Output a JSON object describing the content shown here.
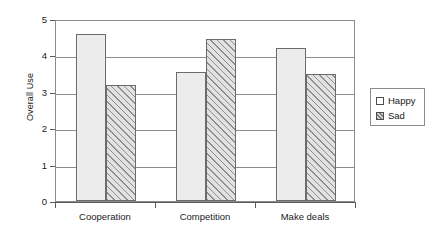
{
  "chart_data": {
    "type": "bar",
    "title": "",
    "xlabel": "",
    "ylabel": "Overall Use",
    "ylim": [
      0,
      5
    ],
    "ytick_labels": [
      "0",
      "1",
      "2",
      "3",
      "4",
      "5"
    ],
    "yticks": [
      0,
      1,
      2,
      3,
      4,
      5
    ],
    "grid": true,
    "legend_position": "right",
    "categories": [
      "Cooperation",
      "Competition",
      "Make deals"
    ],
    "series": [
      {
        "name": "Happy",
        "values": [
          4.6,
          3.55,
          4.2
        ],
        "fill": "#ececec",
        "pattern": "solid"
      },
      {
        "name": "Sad",
        "values": [
          3.2,
          4.45,
          3.5
        ],
        "fill": "#e2e2e2",
        "pattern": "diagonal-hatch"
      }
    ]
  },
  "legend": {
    "items": [
      {
        "label": "Happy",
        "swatch": "empty-square-icon"
      },
      {
        "label": "Sad",
        "swatch": "hatched-square-icon"
      }
    ]
  },
  "colors": {
    "axis": "#5a5a5a",
    "gridline": "#8c8c8c",
    "bar_border": "#6b6b6b",
    "text": "#1a1a1a",
    "background": "#ffffff"
  }
}
